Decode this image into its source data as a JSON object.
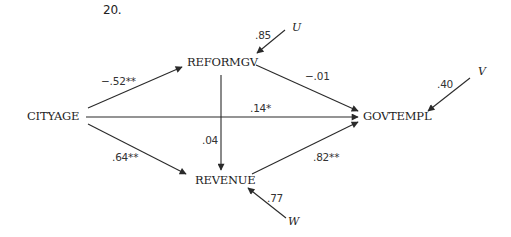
{
  "figure_number": "20.",
  "nodes": {
    "cityage": "CITYAGE",
    "reformgv": "REFORMGV",
    "revenue": "REVENUE",
    "govtempl": "GOVTEMPL"
  },
  "error_terms": {
    "u": "U",
    "v": "V",
    "w": "W"
  },
  "paths": {
    "cityage_reformgv": "−.52**",
    "reformgv_govtempl": "−.01",
    "cityage_govtempl": ".14*",
    "reformgv_revenue": ".04",
    "cityage_revenue": ".64**",
    "revenue_govtempl": ".82**",
    "u_reformgv": ".85",
    "v_govtempl": ".40",
    "w_revenue": ".77"
  },
  "colors": {
    "line": "#2a2a2a",
    "text": "#222222",
    "background": "#ffffff"
  }
}
